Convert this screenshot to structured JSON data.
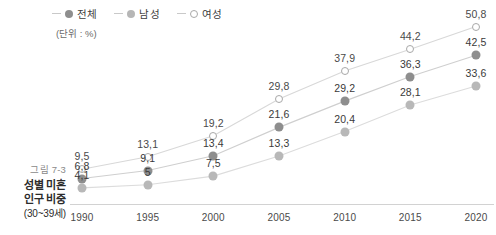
{
  "legend": {
    "items": [
      {
        "label": "전체",
        "marker": "filled-dark-circle-icon",
        "color": "#8e8e8e"
      },
      {
        "label": "남성",
        "marker": "filled-light-circle-icon",
        "color": "#b8b8b8"
      },
      {
        "label": "여성",
        "marker": "open-circle-icon",
        "color": "#ffffff"
      }
    ]
  },
  "unit_note": "(단위 : %)",
  "caption": {
    "figure_number": "그림 7-3",
    "title_line1": "성별 미혼",
    "title_line2": "인구 비중",
    "title_line3": "(30~39세)"
  },
  "chart_data": {
    "type": "line",
    "title": "성별 미혼 인구 비중 (30~39세)",
    "xlabel": "",
    "ylabel": "",
    "unit": "%",
    "grid": false,
    "legend_position": "top",
    "categories": [
      "1990",
      "1995",
      "2000",
      "2005",
      "2010",
      "2015",
      "2020"
    ],
    "ylim": [
      0,
      55
    ],
    "series": [
      {
        "name": "여성",
        "marker": "open-circle",
        "color": "#ffffff",
        "values": [
          9.5,
          13.1,
          19.2,
          29.8,
          37.9,
          44.2,
          50.8
        ],
        "labels": [
          "9,5",
          "13,1",
          "19,2",
          "29,8",
          "37,9",
          "44,2",
          "50,8"
        ]
      },
      {
        "name": "전체",
        "marker": "filled-dark-circle",
        "color": "#8e8e8e",
        "values": [
          6.8,
          9.1,
          13.4,
          21.6,
          29.2,
          36.3,
          42.5
        ],
        "labels": [
          "6,8",
          "9,1",
          "13,4",
          "21,6",
          "29,2",
          "36,3",
          "42,5"
        ]
      },
      {
        "name": "남성",
        "marker": "filled-light-circle",
        "color": "#b8b8b8",
        "values": [
          4.1,
          5.0,
          7.5,
          13.3,
          20.4,
          28.1,
          33.6
        ],
        "labels": [
          "4,1",
          "5",
          "7,5",
          "13,3",
          "20,4",
          "28,1",
          "33,6"
        ]
      }
    ]
  }
}
